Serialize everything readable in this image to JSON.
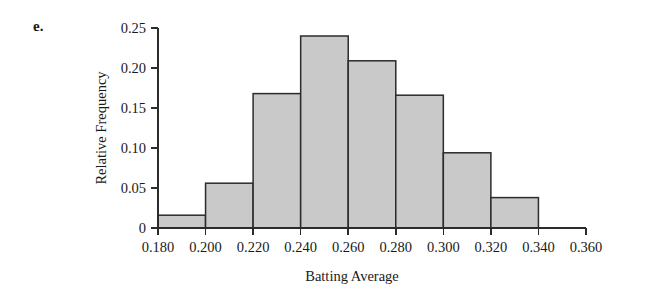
{
  "figure": {
    "part_label": "e.",
    "bar_fill_color": "#c9c9c9",
    "bar_edge_color": "#2b2b2b",
    "axis_color": "#2b2b2b",
    "background_color": "#ffffff"
  },
  "chart_data": {
    "type": "bar",
    "title": "",
    "subtitle": "",
    "xlabel": "Batting Average",
    "ylabel": "Relative Frequency",
    "xlim": [
      0.18,
      0.36
    ],
    "ylim": [
      0,
      0.25
    ],
    "grid": false,
    "legend": null,
    "histogram": true,
    "bin_width": 0.02,
    "bin_edges": [
      0.18,
      0.2,
      0.22,
      0.24,
      0.26,
      0.28,
      0.3,
      0.32,
      0.34
    ],
    "categories": [
      "0.180-0.200",
      "0.200-0.220",
      "0.220-0.240",
      "0.240-0.260",
      "0.260-0.280",
      "0.280-0.300",
      "0.300-0.320",
      "0.320-0.340"
    ],
    "values": [
      0.016,
      0.056,
      0.168,
      0.24,
      0.209,
      0.166,
      0.094,
      0.038
    ],
    "xticks": [
      0.18,
      0.2,
      0.22,
      0.24,
      0.26,
      0.28,
      0.3,
      0.32,
      0.34,
      0.36
    ],
    "xticklabels": [
      "0.180",
      "0.200",
      "0.220",
      "0.240",
      "0.260",
      "0.280",
      "0.300",
      "0.320",
      "0.340",
      "0.360"
    ],
    "yticks": [
      0,
      0.05,
      0.1,
      0.15,
      0.2,
      0.25
    ],
    "yticklabels": [
      "0",
      "0.05",
      "0.10",
      "0.15",
      "0.20",
      "0.25"
    ]
  }
}
